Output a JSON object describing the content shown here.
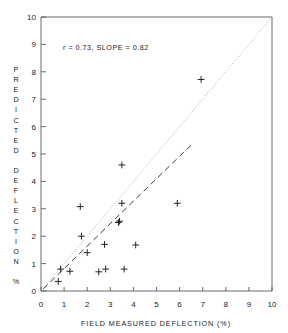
{
  "chart_data": {
    "type": "scatter",
    "title": "",
    "xlabel": "FIELD MEASURED DEFLECTION (%)",
    "ylabel": "PREDICTED DEFLECTION %",
    "ylabel_chars": [
      "P",
      "R",
      "E",
      "D",
      "I",
      "C",
      "T",
      "E",
      "D",
      "",
      "D",
      "E",
      "F",
      "L",
      "E",
      "C",
      "T",
      "I",
      "O",
      "N",
      "",
      "%"
    ],
    "xlim": [
      0,
      10
    ],
    "ylim": [
      0,
      10
    ],
    "xticks": [
      0,
      1,
      2,
      3,
      4,
      5,
      6,
      7,
      8,
      9,
      10
    ],
    "yticks": [
      0,
      1,
      2,
      3,
      4,
      5,
      6,
      7,
      8,
      9,
      10
    ],
    "xtick_labels": [
      "0",
      "1",
      "2",
      "3",
      "4",
      "5",
      "6",
      "7",
      "8",
      "9",
      "10"
    ],
    "ytick_labels": [
      "0",
      "1",
      "2",
      "3",
      "4",
      "5",
      "6",
      "7",
      "8",
      "9",
      "10"
    ],
    "grid": false,
    "legend": null,
    "marker_symbol": "plus",
    "annotation": "r = 0.73, SLOPE = 0.82",
    "statistics": {
      "r": 0.73,
      "slope": 0.82
    },
    "points": [
      {
        "x": 0.75,
        "y": 0.35
      },
      {
        "x": 0.85,
        "y": 0.8
      },
      {
        "x": 1.25,
        "y": 0.72
      },
      {
        "x": 1.7,
        "y": 3.08
      },
      {
        "x": 1.75,
        "y": 2.0
      },
      {
        "x": 2.0,
        "y": 1.4
      },
      {
        "x": 2.5,
        "y": 0.7
      },
      {
        "x": 2.75,
        "y": 1.7
      },
      {
        "x": 2.8,
        "y": 0.8
      },
      {
        "x": 3.35,
        "y": 2.5
      },
      {
        "x": 3.4,
        "y": 2.55
      },
      {
        "x": 3.5,
        "y": 4.6
      },
      {
        "x": 3.5,
        "y": 3.2
      },
      {
        "x": 3.6,
        "y": 0.8
      },
      {
        "x": 4.1,
        "y": 1.68
      },
      {
        "x": 5.9,
        "y": 3.2
      },
      {
        "x": 6.93,
        "y": 7.72
      }
    ],
    "reference_line": {
      "name": "one-to-one line",
      "style": "dotted",
      "x": [
        0,
        10
      ],
      "y": [
        0,
        10
      ]
    },
    "fit_line": {
      "name": "regression line",
      "style": "dashed",
      "slope": 0.82,
      "intercept": 0,
      "x": [
        0.1,
        6.6
      ],
      "y": [
        0.08,
        5.41
      ]
    }
  }
}
